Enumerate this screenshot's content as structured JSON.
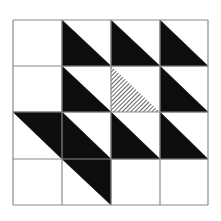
{
  "figure": {
    "description": "4x4 grid of squares with black right triangles and one hatched triangle",
    "grid": {
      "rows": 4,
      "cols": 4,
      "x_lines": [
        13,
        62,
        111,
        160,
        208
      ],
      "y_lines": [
        20,
        66,
        112,
        159,
        205
      ],
      "line_color": "#8a8a8a",
      "line_width": 1.2
    },
    "colors": {
      "fill": "#0d0d0d",
      "hatch_line": "#3a3a3a",
      "hatch_bg": "#ffffff",
      "background": "#ffffff"
    },
    "cells": [
      {
        "row": 0,
        "col": 0,
        "fill": "none",
        "half": ""
      },
      {
        "row": 0,
        "col": 1,
        "fill": "black",
        "half": "lower-left"
      },
      {
        "row": 0,
        "col": 2,
        "fill": "black",
        "half": "lower-left"
      },
      {
        "row": 0,
        "col": 3,
        "fill": "black",
        "half": "lower-left"
      },
      {
        "row": 1,
        "col": 0,
        "fill": "none",
        "half": ""
      },
      {
        "row": 1,
        "col": 1,
        "fill": "black",
        "half": "lower-left"
      },
      {
        "row": 1,
        "col": 2,
        "fill": "hatched",
        "half": "lower-left"
      },
      {
        "row": 1,
        "col": 3,
        "fill": "black",
        "half": "lower-left"
      },
      {
        "row": 2,
        "col": 0,
        "fill": "black",
        "half": "upper-right"
      },
      {
        "row": 2,
        "col": 1,
        "fill": "black",
        "half": "lower-left"
      },
      {
        "row": 2,
        "col": 2,
        "fill": "black",
        "half": "lower-left"
      },
      {
        "row": 2,
        "col": 3,
        "fill": "black",
        "half": "lower-left"
      },
      {
        "row": 3,
        "col": 0,
        "fill": "none",
        "half": ""
      },
      {
        "row": 3,
        "col": 1,
        "fill": "black",
        "half": "upper-right"
      },
      {
        "row": 3,
        "col": 2,
        "fill": "none",
        "half": ""
      },
      {
        "row": 3,
        "col": 3,
        "fill": "none",
        "half": ""
      }
    ],
    "summary": {
      "black_triangles": 11,
      "hatched_triangles": 1,
      "empty_cells": 5
    }
  }
}
